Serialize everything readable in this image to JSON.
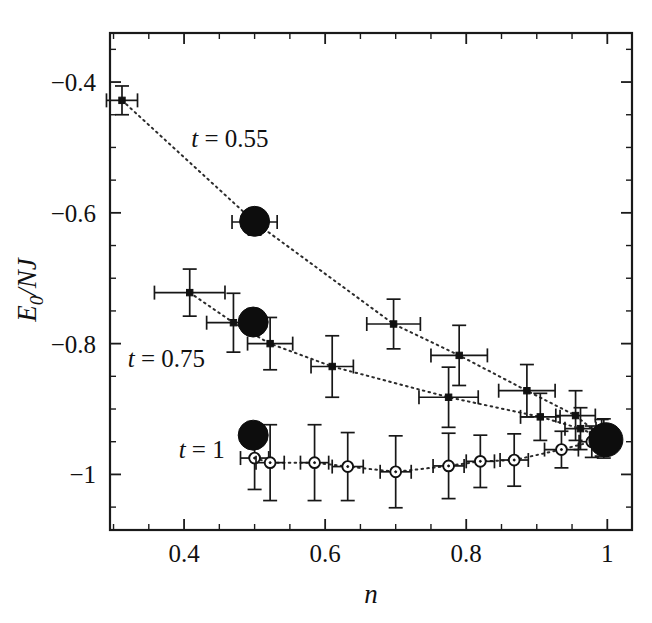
{
  "chart_data": {
    "type": "scatter",
    "title": "",
    "xlabel": "n",
    "ylabel": "E_0/NJ",
    "ylabel_display": "E₀/NJ",
    "xlim": [
      0.295,
      1.035
    ],
    "ylim": [
      -1.085,
      -0.325
    ],
    "grid": false,
    "legend_position": "inline-annotations",
    "xticks": [
      0.4,
      0.6,
      0.8,
      1.0
    ],
    "xtick_labels": [
      "0.4",
      "0.6",
      "0.8",
      "1"
    ],
    "xticks_minor_step": 0.05,
    "yticks": [
      -0.4,
      -0.6,
      -0.8,
      -1.0
    ],
    "ytick_labels": [
      "−0.4",
      "−0.6",
      "−0.8",
      "−1"
    ],
    "yticks_minor_step": 0.05,
    "annotations": [
      {
        "text": "t = 0.55",
        "var": "t",
        "rest": " = 0.55",
        "x": 0.465,
        "y": -0.5
      },
      {
        "text": "t = 0.75",
        "var": "t",
        "rest": " = 0.75",
        "x": 0.375,
        "y": -0.835
      },
      {
        "text": "t = 1",
        "var": "t",
        "rest": " = 1",
        "x": 0.425,
        "y": -0.975
      }
    ],
    "series": [
      {
        "name": "t = 0.55",
        "t": 0.55,
        "marker": "filled-plus",
        "line": "dotted",
        "points": [
          {
            "x": 0.312,
            "y": -0.428,
            "xerr": 0.022,
            "yerr": 0.022
          },
          {
            "x": 0.5,
            "y": -0.614,
            "xerr": 0.032,
            "yerr": 0.02,
            "highlight": true
          },
          {
            "x": 0.697,
            "y": -0.77,
            "xerr": 0.038,
            "yerr": 0.038
          },
          {
            "x": 0.79,
            "y": -0.818,
            "xerr": 0.04,
            "yerr": 0.046
          },
          {
            "x": 0.886,
            "y": -0.872,
            "xerr": 0.04,
            "yerr": 0.04
          },
          {
            "x": 0.955,
            "y": -0.91,
            "xerr": 0.028,
            "yerr": 0.038
          },
          {
            "x": 0.995,
            "y": -0.945,
            "xerr": 0.02,
            "yerr": 0.03
          }
        ]
      },
      {
        "name": "t = 0.75",
        "t": 0.75,
        "marker": "filled-plus",
        "line": "dotted",
        "points": [
          {
            "x": 0.408,
            "y": -0.722,
            "xerr": 0.05,
            "yerr": 0.036
          },
          {
            "x": 0.47,
            "y": -0.768,
            "xerr": 0.038,
            "yerr": 0.045
          },
          {
            "x": 0.522,
            "y": -0.8,
            "xerr": 0.032,
            "yerr": 0.04
          },
          {
            "x": 0.61,
            "y": -0.835,
            "xerr": 0.03,
            "yerr": 0.047
          },
          {
            "x": 0.775,
            "y": -0.882,
            "xerr": 0.042,
            "yerr": 0.046
          },
          {
            "x": 0.905,
            "y": -0.912,
            "xerr": 0.028,
            "yerr": 0.036
          },
          {
            "x": 0.962,
            "y": -0.93,
            "xerr": 0.022,
            "yerr": 0.032
          },
          {
            "x": 0.992,
            "y": -0.944,
            "xerr": 0.016,
            "yerr": 0.028
          }
        ]
      },
      {
        "name": "t = 1",
        "t": 1,
        "marker": "open-circle",
        "line": "dotted",
        "points": [
          {
            "x": 0.5,
            "y": -0.975,
            "xerr": 0.02,
            "yerr": 0.048
          },
          {
            "x": 0.522,
            "y": -0.982,
            "xerr": 0.02,
            "yerr": 0.058
          },
          {
            "x": 0.585,
            "y": -0.982,
            "xerr": 0.02,
            "yerr": 0.058
          },
          {
            "x": 0.632,
            "y": -0.988,
            "xerr": 0.022,
            "yerr": 0.052
          },
          {
            "x": 0.7,
            "y": -0.996,
            "xerr": 0.022,
            "yerr": 0.055
          },
          {
            "x": 0.775,
            "y": -0.987,
            "xerr": 0.022,
            "yerr": 0.05
          },
          {
            "x": 0.82,
            "y": -0.98,
            "xerr": 0.02,
            "yerr": 0.04
          },
          {
            "x": 0.868,
            "y": -0.978,
            "xerr": 0.02,
            "yerr": 0.04
          },
          {
            "x": 0.935,
            "y": -0.962,
            "xerr": 0.024,
            "yerr": 0.028
          },
          {
            "x": 0.978,
            "y": -0.95,
            "xerr": 0.018,
            "yerr": 0.024
          }
        ]
      }
    ],
    "highlight_points": [
      {
        "x": 0.5,
        "y": -0.613,
        "series": "t = 0.55",
        "radius_px": 15
      },
      {
        "x": 0.498,
        "y": -0.767,
        "series": "t = 0.75",
        "radius_px": 15
      },
      {
        "x": 0.498,
        "y": -0.94,
        "series": "t = 1",
        "radius_px": 15
      },
      {
        "x": 0.998,
        "y": -0.947,
        "series": "converged",
        "radius_px": 17
      }
    ]
  }
}
